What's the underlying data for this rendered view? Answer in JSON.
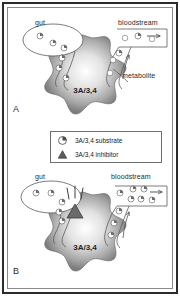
{
  "figure": {
    "type": "biological-mechanism-diagram",
    "border_color": "#2b2b2b",
    "enzyme_fill_center": "#ffffff",
    "enzyme_fill_edge": "#8c8c8c",
    "line_color": "#555555"
  },
  "legend": {
    "items": [
      {
        "icon": "substrate-circle-icon",
        "label": "3A/3,4 substrate"
      },
      {
        "icon": "inhibitor-triangle-icon",
        "label": "3A/3,4 inhibitor"
      }
    ]
  },
  "panels": [
    {
      "id": "A",
      "letter": "A",
      "gut_label": "gut",
      "bloodstream_label": "bloodstream",
      "enzyme_label": "3A/3,4",
      "metabolite_label": "metabolite",
      "gut_substrate_count": 3,
      "transit_substrate_count": 4,
      "bloodstream_substrate_count": 3,
      "bloodstream_metabolite_count": 3,
      "inhibitor_present": false,
      "flow_arrow": "right-arrow-icon"
    },
    {
      "id": "B",
      "letter": "B",
      "gut_label": "gut",
      "bloodstream_label": "bloodstream",
      "enzyme_label": "3A/3,4",
      "metabolite_label": "",
      "gut_substrate_count": 4,
      "transit_substrate_count": 4,
      "bloodstream_substrate_count": 7,
      "bloodstream_metabolite_count": 0,
      "inhibitor_present": true,
      "flow_arrow": "right-arrow-icon"
    }
  ]
}
